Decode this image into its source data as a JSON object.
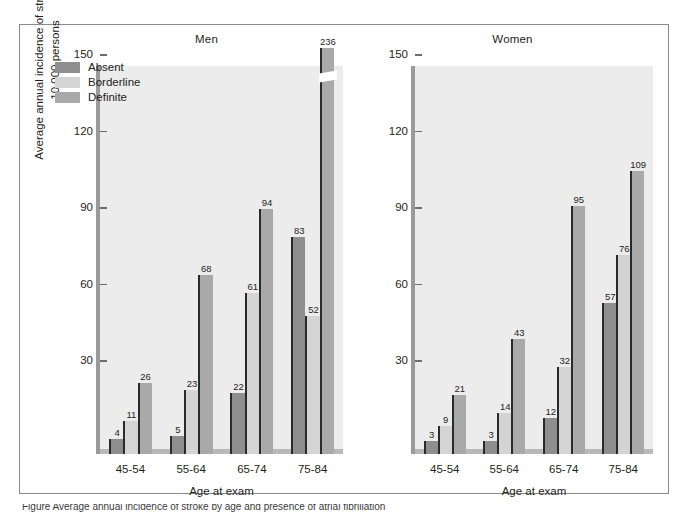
{
  "figure": {
    "caption_partial": "Figure  Average annual incidence of stroke by age and presence of atrial fibrillation",
    "y_axis_title": "Average annual incidence of stroke per 10,000 persons",
    "x_axis_title": "Age at exam",
    "y_ticks": [
      30,
      60,
      90,
      120,
      150
    ],
    "y_max": 150,
    "colors": {
      "absent": "#8e8e8e",
      "borderline": "#d4d4d4",
      "definite": "#a9a9a9",
      "plot_background": "#ececec",
      "axis": "#9a9a9a",
      "bar_edge": "#2a2a2a",
      "frame": "#8b8b8b"
    }
  },
  "legend": {
    "items": [
      {
        "label": "Absent",
        "color": "#8e8e8e"
      },
      {
        "label": "Borderline",
        "color": "#d4d4d4"
      },
      {
        "label": "Definite",
        "color": "#a9a9a9"
      }
    ]
  },
  "chart_data": {
    "type": "bar",
    "xlabel": "Age at exam",
    "ylabel": "Average annual incidence of stroke per 10,000 persons",
    "ylim": [
      0,
      150
    ],
    "yticks": [
      30,
      60,
      90,
      120,
      150
    ],
    "grid": false,
    "legend_position": "upper-left (Men panel)",
    "categories": [
      "45-54",
      "55-64",
      "65-74",
      "75-84"
    ],
    "panels": [
      {
        "name": "Men",
        "series": [
          {
            "name": "Absent",
            "values": [
              4,
              5,
              22,
              83
            ]
          },
          {
            "name": "Borderline",
            "values": [
              11,
              23,
              61,
              52
            ]
          },
          {
            "name": "Definite",
            "values": [
              26,
              68,
              94,
              236
            ]
          }
        ]
      },
      {
        "name": "Women",
        "series": [
          {
            "name": "Absent",
            "values": [
              3,
              3,
              12,
              57
            ]
          },
          {
            "name": "Borderline",
            "values": [
              9,
              14,
              32,
              76
            ]
          },
          {
            "name": "Definite",
            "values": [
              21,
              43,
              95,
              109
            ]
          }
        ]
      }
    ],
    "annotations": [
      {
        "text": "236",
        "note": "Definite, Men 75-84 — bar is broken (axis break) because value exceeds 150 scale"
      }
    ]
  },
  "panels": {
    "men": {
      "title": "Men"
    },
    "women": {
      "title": "Women"
    }
  }
}
